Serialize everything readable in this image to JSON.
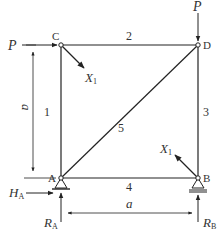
{
  "diagram": {
    "type": "truss",
    "nodes": {
      "A": {
        "label": "A",
        "x": 61,
        "y": 178
      },
      "B": {
        "label": "B",
        "x": 198,
        "y": 178
      },
      "C": {
        "label": "C",
        "x": 61,
        "y": 45
      },
      "D": {
        "label": "D",
        "x": 198,
        "y": 45
      }
    },
    "members": [
      {
        "id": "1",
        "label": "1",
        "from": "A",
        "to": "C"
      },
      {
        "id": "2",
        "label": "2",
        "from": "C",
        "to": "D"
      },
      {
        "id": "3",
        "label": "3",
        "from": "D",
        "to": "B"
      },
      {
        "id": "4",
        "label": "4",
        "from": "A",
        "to": "B"
      },
      {
        "id": "5",
        "label": "5",
        "from": "A",
        "to": "D"
      }
    ],
    "loads": {
      "horizontal_at_C": {
        "label": "P"
      },
      "vertical_at_D": {
        "label": "P"
      }
    },
    "redundant": {
      "at_C": {
        "label": "X",
        "subscript": "1"
      },
      "at_B": {
        "label": "X",
        "subscript": "1"
      }
    },
    "reactions": {
      "HA": {
        "label": "H",
        "subscript": "A"
      },
      "RA": {
        "label": "R",
        "subscript": "A"
      },
      "RB": {
        "label": "R",
        "subscript": "B"
      }
    },
    "dimensions": {
      "height": {
        "label": "a"
      },
      "width": {
        "label": "a"
      }
    }
  }
}
